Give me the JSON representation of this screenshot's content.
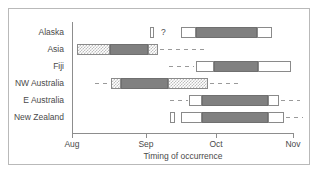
{
  "chart_data": {
    "type": "bar",
    "title": "",
    "xlabel": "Timing of occurrence",
    "ylabel": "",
    "grid": false,
    "legend": null,
    "orientation": "horizontal",
    "axis": {
      "tick_labels": [
        "Aug",
        "Sep",
        "Oct",
        "Nov"
      ],
      "tick_values": [
        0,
        1,
        2,
        3
      ],
      "xlim": [
        0,
        3
      ],
      "tick_px": [
        72,
        146,
        216,
        293
      ]
    },
    "categories": [
      "Alaska",
      "Asia",
      "Fiji",
      "NW Australia",
      "E Australia",
      "New Zealand"
    ],
    "annotations": [
      {
        "text": "?",
        "category": "Alaska",
        "x_px": 161
      }
    ],
    "series": [
      {
        "name": "Alaska",
        "segments": [
          {
            "style": "open",
            "x0_px": 150,
            "x1_px": 154
          },
          {
            "style": "open",
            "x0_px": 181,
            "x1_px": 196
          },
          {
            "style": "solid",
            "x0_px": 196,
            "x1_px": 257
          },
          {
            "style": "open",
            "x0_px": 257,
            "x1_px": 272
          }
        ],
        "dashes": []
      },
      {
        "name": "Asia",
        "segments": [
          {
            "style": "hatch",
            "x0_px": 77,
            "x1_px": 110
          },
          {
            "style": "solid",
            "x0_px": 110,
            "x1_px": 148
          },
          {
            "style": "hatch",
            "x0_px": 148,
            "x1_px": 158
          }
        ],
        "dashes": [
          {
            "x0_px": 160,
            "x1_px": 206
          }
        ]
      },
      {
        "name": "Fiji",
        "segments": [
          {
            "style": "open",
            "x0_px": 196,
            "x1_px": 214
          },
          {
            "style": "solid",
            "x0_px": 214,
            "x1_px": 258
          },
          {
            "style": "open",
            "x0_px": 258,
            "x1_px": 291
          }
        ],
        "dashes": [
          {
            "x0_px": 169,
            "x1_px": 194
          }
        ]
      },
      {
        "name": "NW Australia",
        "segments": [
          {
            "style": "hatch",
            "x0_px": 111,
            "x1_px": 121
          },
          {
            "style": "solid",
            "x0_px": 121,
            "x1_px": 168
          },
          {
            "style": "hatch",
            "x0_px": 168,
            "x1_px": 208
          }
        ],
        "dashes": [
          {
            "x0_px": 95,
            "x1_px": 110
          },
          {
            "x0_px": 210,
            "x1_px": 240
          }
        ]
      },
      {
        "name": "E Australia",
        "segments": [
          {
            "style": "open",
            "x0_px": 189,
            "x1_px": 202
          },
          {
            "style": "solid",
            "x0_px": 202,
            "x1_px": 268
          },
          {
            "style": "open",
            "x0_px": 268,
            "x1_px": 279
          }
        ],
        "dashes": [
          {
            "x0_px": 170,
            "x1_px": 188
          },
          {
            "x0_px": 281,
            "x1_px": 300
          }
        ]
      },
      {
        "name": "New Zealand",
        "segments": [
          {
            "style": "open",
            "x0_px": 170,
            "x1_px": 175
          },
          {
            "style": "open",
            "x0_px": 181,
            "x1_px": 202
          },
          {
            "style": "solid",
            "x0_px": 202,
            "x1_px": 268
          },
          {
            "style": "open",
            "x0_px": 268,
            "x1_px": 284
          }
        ],
        "dashes": [
          {
            "x0_px": 286,
            "x1_px": 303
          }
        ]
      }
    ],
    "row_y_px": [
      32,
      49,
      66,
      83,
      100,
      117
    ]
  },
  "colors": {
    "solid_fill": "#808080",
    "open_fill": "#ffffff",
    "hatch_fill": "#bdbdbd",
    "outline": "#8a8a8a",
    "axis": "#8d8d8d",
    "text": "#4a4a4a",
    "frame": "#b9b9b9",
    "background": "#ffffff"
  }
}
